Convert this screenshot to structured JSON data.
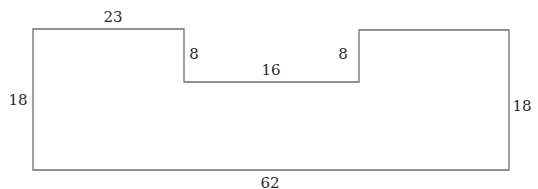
{
  "diagram": {
    "type": "rectilinear-polygon",
    "stroke_color": "#6e6e6e",
    "label_color": "#2a2a2a",
    "vertices": [
      [
        33,
        29
      ],
      [
        184,
        29
      ],
      [
        184,
        82
      ],
      [
        359,
        82
      ],
      [
        359,
        30
      ],
      [
        509,
        30
      ],
      [
        509,
        170
      ],
      [
        33,
        170
      ]
    ],
    "labels": {
      "top_left": "23",
      "notch_left_depth": "8",
      "notch_bottom": "16",
      "notch_right_depth": "8",
      "left_side": "18",
      "right_side": "18",
      "bottom": "62"
    }
  }
}
